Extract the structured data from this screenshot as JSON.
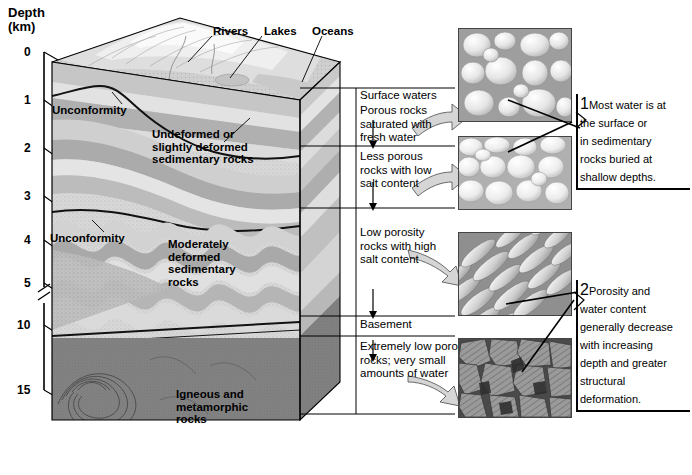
{
  "figure": {
    "axis": {
      "title_line1": "Depth",
      "title_line2": "(km)",
      "ticks": [
        "0",
        "1",
        "2",
        "3",
        "4",
        "5",
        "10",
        "15"
      ],
      "has_break": true
    },
    "surface_labels": [
      {
        "name": "rivers",
        "text": "Rivers"
      },
      {
        "name": "lakes",
        "text": "Lakes"
      },
      {
        "name": "oceans",
        "text": "Oceans"
      }
    ],
    "block_labels": [
      {
        "name": "unconformity-upper",
        "text": "Unconformity"
      },
      {
        "name": "undeformed-rocks",
        "text": "Undeformed or\nslightly deformed\nsedimentary rocks"
      },
      {
        "name": "unconformity-lower",
        "text": "Unconformity"
      },
      {
        "name": "moderately-deformed-rocks",
        "text": "Moderately\ndeformed\nsedimentary\nrocks"
      },
      {
        "name": "igneous-metamorphic-rocks",
        "text": "Igneous and\nmetamorphic\nrocks"
      }
    ],
    "zones": [
      {
        "name": "surface-waters",
        "text": "Surface waters"
      },
      {
        "name": "porous-rocks",
        "text": "Porous rocks\nsaturated with\nfresh water"
      },
      {
        "name": "less-porous-rocks",
        "text": "Less porous\nrocks with low\nsalt content"
      },
      {
        "name": "low-porosity-rocks",
        "text": "Low porosity\nrocks with high\nsalt content"
      },
      {
        "name": "basement",
        "text": "Basement"
      },
      {
        "name": "extremely-low-porosity",
        "text": "Extremely low porosity\nrocks; very small\namounts of water"
      }
    ],
    "micrographs": [
      {
        "name": "micrograph-porous-grains",
        "style": "rounded-grains-open-pores"
      },
      {
        "name": "micrograph-packed-grains",
        "style": "packed-grains-tight-pores"
      },
      {
        "name": "micrograph-elongated-grains",
        "style": "elongated-foliated-grains"
      },
      {
        "name": "micrograph-interlocking-crystals",
        "style": "dark-interlocking-crystals"
      }
    ],
    "callouts": [
      {
        "name": "callout-1",
        "number": "1",
        "text": "Most water is at\nthe surface or\nin sedimentary\nrocks buried at\nshallow depths."
      },
      {
        "name": "callout-2",
        "number": "2",
        "text": "Porosity and\nwater content\ngenerally decrease\nwith increasing\ndepth and greater\nstructural\ndeformation."
      }
    ],
    "colors": {
      "ink": "#000000",
      "rock_light": "#d9d9d9",
      "rock_mid": "#b3b3b3",
      "rock_dark": "#8a8a8a",
      "basement": "#6e6e6e",
      "arrow_fill": "#d5d5d5"
    }
  }
}
